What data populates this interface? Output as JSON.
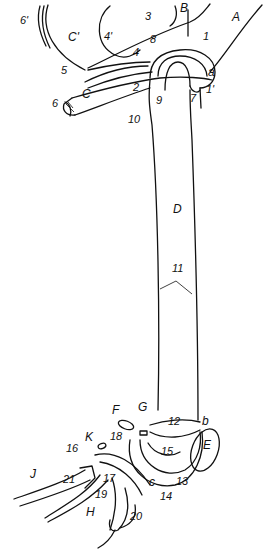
{
  "diagram": {
    "type": "anatomical line drawing",
    "letters": [
      {
        "id": "A",
        "text": "A",
        "x": 232,
        "y": 20
      },
      {
        "id": "B",
        "text": "B",
        "x": 180,
        "y": 11
      },
      {
        "id": "C'",
        "text": "C'",
        "x": 68,
        "y": 40
      },
      {
        "id": "C",
        "text": "C",
        "x": 82,
        "y": 97
      },
      {
        "id": "D",
        "text": "D",
        "x": 173,
        "y": 212
      },
      {
        "id": "E",
        "text": "E",
        "x": 203,
        "y": 448
      },
      {
        "id": "F",
        "text": "F",
        "x": 112,
        "y": 413
      },
      {
        "id": "G",
        "text": "G",
        "x": 138,
        "y": 410
      },
      {
        "id": "H",
        "text": "H",
        "x": 86,
        "y": 515
      },
      {
        "id": "J",
        "text": "J",
        "x": 30,
        "y": 477
      },
      {
        "id": "K",
        "text": "K",
        "x": 85,
        "y": 440
      },
      {
        "id": "a",
        "text": "a",
        "x": 208,
        "y": 75
      },
      {
        "id": "b",
        "text": "b",
        "x": 202,
        "y": 424
      },
      {
        "id": "c",
        "text": "c",
        "x": 149,
        "y": 485
      }
    ],
    "numbers": [
      {
        "text": "1",
        "x": 203,
        "y": 40
      },
      {
        "text": "1'",
        "x": 206,
        "y": 93
      },
      {
        "text": "2",
        "x": 133,
        "y": 91
      },
      {
        "text": "3",
        "x": 145,
        "y": 20
      },
      {
        "text": "4",
        "x": 133,
        "y": 56
      },
      {
        "text": "4'",
        "x": 104,
        "y": 40
      },
      {
        "text": "5",
        "x": 61,
        "y": 74
      },
      {
        "text": "6",
        "x": 52,
        "y": 107
      },
      {
        "text": "6'",
        "x": 20,
        "y": 24
      },
      {
        "text": "7",
        "x": 190,
        "y": 102
      },
      {
        "text": "8",
        "x": 150,
        "y": 43
      },
      {
        "text": "9",
        "x": 156,
        "y": 104
      },
      {
        "text": "10",
        "x": 128,
        "y": 123
      },
      {
        "text": "11",
        "x": 172,
        "y": 272
      },
      {
        "text": "12",
        "x": 168,
        "y": 425
      },
      {
        "text": "13",
        "x": 176,
        "y": 485
      },
      {
        "text": "14",
        "x": 160,
        "y": 500
      },
      {
        "text": "15",
        "x": 161,
        "y": 455
      },
      {
        "text": "16",
        "x": 66,
        "y": 452
      },
      {
        "text": "17",
        "x": 103,
        "y": 482
      },
      {
        "text": "18",
        "x": 110,
        "y": 440
      },
      {
        "text": "19",
        "x": 95,
        "y": 498
      },
      {
        "text": "20",
        "x": 130,
        "y": 520
      },
      {
        "text": "21",
        "x": 63,
        "y": 483
      }
    ]
  }
}
